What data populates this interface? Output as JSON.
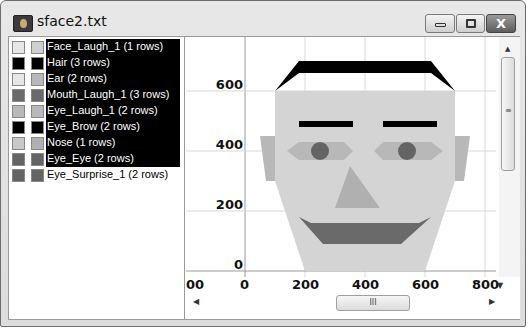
{
  "window": {
    "title": "sface2.txt",
    "buttons": {
      "minimize": "minimize",
      "maximize": "maximize",
      "close": "X"
    }
  },
  "legend": {
    "items": [
      {
        "label": "Face_Laugh_1 (1 rows)",
        "color_a": "#e6e6e6",
        "color_b": "#cfcfcf",
        "selected": true
      },
      {
        "label": "Hair (3 rows)",
        "color_a": "#000000",
        "color_b": "#000000",
        "selected": true
      },
      {
        "label": "Ear (2 rows)",
        "color_a": "#e6e6e6",
        "color_b": "#b8b8b8",
        "selected": true
      },
      {
        "label": "Mouth_Laugh_1 (3 rows)",
        "color_a": "#6a6a6a",
        "color_b": "#6a6a6a",
        "selected": true
      },
      {
        "label": "Eye_Laugh_1 (2 rows)",
        "color_a": "#b8b8b8",
        "color_b": "#b8b8b8",
        "selected": true
      },
      {
        "label": "Eye_Brow (2 rows)",
        "color_a": "#000000",
        "color_b": "#000000",
        "selected": true
      },
      {
        "label": "Nose (1 rows)",
        "color_a": "#c8c8c8",
        "color_b": "#b0b0b0",
        "selected": true
      },
      {
        "label": "Eye_Eye (2 rows)",
        "color_a": "#646464",
        "color_b": "#646464",
        "selected": true
      },
      {
        "label": "Eye_Surprise_1 (2 rows)",
        "color_a": "#646464",
        "color_b": "#646464",
        "selected": false
      }
    ]
  },
  "chart_data": {
    "type": "polygon-scatter",
    "title": "",
    "xlabel": "",
    "ylabel": "",
    "x_ticks": [
      "00",
      "0",
      "200",
      "400",
      "600",
      "800"
    ],
    "y_ticks": [
      "0",
      "200",
      "400",
      "600"
    ],
    "xlim": [
      -200,
      820
    ],
    "ylim": [
      0,
      700
    ],
    "grid": true,
    "shapes": [
      {
        "name": "Ear",
        "color": "#b8b8b8",
        "points": [
          [
            50,
            450
          ],
          [
            100,
            450
          ],
          [
            100,
            300
          ],
          [
            70,
            300
          ]
        ]
      },
      {
        "name": "Ear",
        "color": "#b8b8b8",
        "points": [
          [
            700,
            450
          ],
          [
            750,
            450
          ],
          [
            730,
            300
          ],
          [
            700,
            300
          ]
        ]
      },
      {
        "name": "Face_Laugh_1",
        "color": "#d4d4d4",
        "points": [
          [
            100,
            600
          ],
          [
            700,
            600
          ],
          [
            700,
            300
          ],
          [
            600,
            0
          ],
          [
            200,
            0
          ],
          [
            100,
            300
          ]
        ]
      },
      {
        "name": "Hair",
        "color": "#000000",
        "points": [
          [
            100,
            600
          ],
          [
            180,
            700
          ],
          [
            620,
            700
          ],
          [
            700,
            600
          ],
          [
            620,
            660
          ],
          [
            180,
            660
          ]
        ]
      },
      {
        "name": "Eye_Brow",
        "color": "#000000",
        "points": [
          [
            180,
            500
          ],
          [
            360,
            500
          ],
          [
            360,
            480
          ],
          [
            180,
            480
          ]
        ]
      },
      {
        "name": "Eye_Brow",
        "color": "#000000",
        "points": [
          [
            460,
            500
          ],
          [
            640,
            500
          ],
          [
            640,
            480
          ],
          [
            460,
            480
          ]
        ]
      },
      {
        "name": "Eye_Laugh_1",
        "color": "#b8b8b8",
        "points": [
          [
            140,
            400
          ],
          [
            180,
            430
          ],
          [
            330,
            430
          ],
          [
            360,
            400
          ],
          [
            330,
            370
          ],
          [
            180,
            370
          ]
        ]
      },
      {
        "name": "Eye_Laugh_1",
        "color": "#b8b8b8",
        "points": [
          [
            430,
            400
          ],
          [
            460,
            430
          ],
          [
            620,
            430
          ],
          [
            660,
            400
          ],
          [
            620,
            370
          ],
          [
            460,
            370
          ]
        ]
      },
      {
        "name": "Eye_Eye",
        "color": "#646464",
        "points": [
          [
            250,
            400
          ]
        ],
        "radius": 30
      },
      {
        "name": "Eye_Eye",
        "color": "#646464",
        "points": [
          [
            540,
            400
          ]
        ],
        "radius": 30
      },
      {
        "name": "Nose",
        "color": "#b0b0b0",
        "points": [
          [
            350,
            350
          ],
          [
            300,
            210
          ],
          [
            450,
            210
          ]
        ]
      },
      {
        "name": "Mouth_Laugh_1",
        "color": "#6a6a6a",
        "points": [
          [
            180,
            180
          ],
          [
            220,
            160
          ],
          [
            580,
            160
          ],
          [
            620,
            180
          ],
          [
            520,
            90
          ],
          [
            260,
            90
          ]
        ]
      }
    ]
  },
  "scrollbars": {
    "vertical_grip": "≡",
    "horizontal_grip": "III",
    "up_arrow": "▲",
    "down_arrow": "▼",
    "left_arrow": "◀",
    "right_arrow": "▶"
  }
}
